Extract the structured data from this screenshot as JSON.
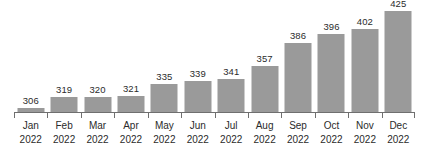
{
  "chart_data": {
    "type": "bar",
    "title": "",
    "subtitle": "",
    "xlabel": "",
    "ylabel": "",
    "categories": [
      "Jan 2022",
      "Feb 2022",
      "Mar 2022",
      "Apr 2022",
      "May 2022",
      "Jun 2022",
      "Jul 2022",
      "Aug 2022",
      "Sep 2022",
      "Oct 2022",
      "Nov 2022",
      "Dec 2022"
    ],
    "category_lines": [
      [
        "Jan",
        "2022"
      ],
      [
        "Feb",
        "2022"
      ],
      [
        "Mar",
        "2022"
      ],
      [
        "Apr",
        "2022"
      ],
      [
        "May",
        "2022"
      ],
      [
        "Jun",
        "2022"
      ],
      [
        "Jul",
        "2022"
      ],
      [
        "Aug",
        "2022"
      ],
      [
        "Sep",
        "2022"
      ],
      [
        "Oct",
        "2022"
      ],
      [
        "Nov",
        "2022"
      ],
      [
        "Dec",
        "2022"
      ]
    ],
    "values": [
      306,
      319,
      320,
      321,
      335,
      339,
      341,
      357,
      386,
      396,
      402,
      425
    ],
    "data_labels": [
      "306",
      "319",
      "320",
      "321",
      "335",
      "339",
      "341",
      "357",
      "386",
      "396",
      "402",
      "425"
    ],
    "ylim": [
      300,
      433
    ],
    "axis_baseline_value": 300,
    "grid": false,
    "legend": false,
    "legend_position": "none",
    "y_axis_visible": false,
    "x_axis_visible": true,
    "series": [
      {
        "name": "",
        "values": [
          306,
          319,
          320,
          321,
          335,
          339,
          341,
          357,
          386,
          396,
          402,
          425
        ]
      }
    ],
    "colors": {
      "bar": "#9a9a9a",
      "axis": "#6f6f6f",
      "label_text": "#2b2b2b",
      "background": "#ffffff"
    }
  }
}
